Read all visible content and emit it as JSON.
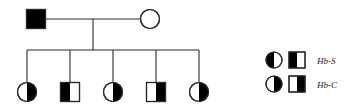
{
  "figure": {
    "type": "pedigree-chart",
    "stroke_color": "#2b2b2b",
    "fill_color": "#000000",
    "background": "#ffffff"
  },
  "generations": [
    {
      "id": "generation-1",
      "individuals": [
        {
          "id": "father",
          "shape": "square",
          "sex": "male",
          "fill": "full",
          "x": 36,
          "y": 19,
          "size": 19
        },
        {
          "id": "mother",
          "shape": "circle",
          "sex": "female",
          "fill": "none",
          "x": 150,
          "y": 19,
          "size": 19
        }
      ]
    },
    {
      "id": "generation-2",
      "individuals": [
        {
          "id": "child-1",
          "shape": "circle",
          "sex": "female",
          "fill": "right-half",
          "trait": "Hb-C",
          "x": 27,
          "y": 92,
          "size": 19
        },
        {
          "id": "child-2",
          "shape": "square",
          "sex": "male",
          "fill": "left-half",
          "trait": "Hb-S",
          "x": 70,
          "y": 92,
          "size": 19
        },
        {
          "id": "child-3",
          "shape": "circle",
          "sex": "female",
          "fill": "right-half",
          "trait": "Hb-C",
          "x": 113,
          "y": 92,
          "size": 19
        },
        {
          "id": "child-4",
          "shape": "square",
          "sex": "male",
          "fill": "right-half",
          "trait": "Hb-C",
          "x": 156,
          "y": 92,
          "size": 19
        },
        {
          "id": "child-5",
          "shape": "circle",
          "sex": "female",
          "fill": "right-half",
          "trait": "Hb-C",
          "x": 199,
          "y": 92,
          "size": 19
        }
      ]
    }
  ],
  "connectors": {
    "mating_line": {
      "x1": 46,
      "y1": 19,
      "x2": 140,
      "y2": 19
    },
    "descent_line": {
      "x": 93,
      "y1": 19,
      "y2": 50
    },
    "sibship_line": {
      "x1": 27,
      "y": 50,
      "x2": 199
    },
    "drop_lines": [
      {
        "x": 27,
        "y1": 50,
        "y2": 83
      },
      {
        "x": 70,
        "y1": 50,
        "y2": 83
      },
      {
        "x": 113,
        "y1": 50,
        "y2": 83
      },
      {
        "x": 156,
        "y1": 50,
        "y2": 83
      },
      {
        "x": 199,
        "y1": 50,
        "y2": 83
      }
    ]
  },
  "legend": {
    "rows": [
      {
        "id": "legend-row-hbs",
        "circle_fill": "left-half",
        "square_fill": "left-half",
        "label": "Hb-S",
        "circle_x": 274,
        "square_x": 297,
        "y": 60,
        "label_x": 317
      },
      {
        "id": "legend-row-hbc",
        "circle_fill": "right-half",
        "square_fill": "right-half",
        "label": "Hb-C",
        "circle_x": 274,
        "square_x": 297,
        "y": 84,
        "label_x": 317
      }
    ]
  }
}
